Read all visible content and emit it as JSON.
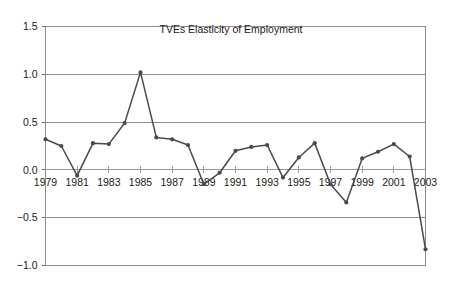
{
  "chart_data": {
    "type": "line",
    "title": "TVEs Elasticity of Employment",
    "xlabel": "",
    "ylabel": "",
    "x": [
      1979,
      1980,
      1981,
      1982,
      1983,
      1984,
      1985,
      1986,
      1987,
      1988,
      1989,
      1990,
      1991,
      1992,
      1993,
      1994,
      1995,
      1996,
      1997,
      1998,
      1999,
      2000,
      2001,
      2002,
      2003
    ],
    "values": [
      0.32,
      0.25,
      -0.06,
      0.28,
      0.27,
      0.49,
      1.02,
      0.34,
      0.32,
      0.26,
      -0.15,
      -0.03,
      0.2,
      0.24,
      0.26,
      -0.08,
      0.13,
      0.28,
      -0.15,
      -0.34,
      0.12,
      0.19,
      0.27,
      0.14,
      -0.83
    ],
    "series": [
      {
        "name": "TVEs Elasticity of Employment",
        "values": [
          0.32,
          0.25,
          -0.06,
          0.28,
          0.27,
          0.49,
          1.02,
          0.34,
          0.32,
          0.26,
          -0.15,
          -0.03,
          0.2,
          0.24,
          0.26,
          -0.08,
          0.13,
          0.28,
          -0.15,
          -0.34,
          0.12,
          0.19,
          0.27,
          0.14,
          -0.83
        ]
      }
    ],
    "xlim": [
      1979,
      2003
    ],
    "ylim": [
      -1.0,
      1.5
    ],
    "yticks": [
      -1.0,
      -0.5,
      0.0,
      0.5,
      1.0,
      1.5
    ],
    "ytick_labels": [
      "−1.0",
      "−0.5",
      "0.0",
      "0.5",
      "1.0",
      "1.5"
    ],
    "xticks": [
      1979,
      1981,
      1983,
      1985,
      1987,
      1989,
      1991,
      1993,
      1995,
      1997,
      1999,
      2001,
      2003
    ],
    "xtick_labels": [
      "1979",
      "1981",
      "1983",
      "1985",
      "1987",
      "1989",
      "1991",
      "1993",
      "1995",
      "1997",
      "1999",
      "2001",
      "2003"
    ],
    "grid": true,
    "legend": false,
    "legend_position": "none",
    "colors": {
      "line": "#4a4a4a",
      "marker": "#4a4a4a",
      "grid": "#8c8c8c",
      "axis": "#8c8c8c",
      "text": "#1a1a1a",
      "background": "#ffffff"
    }
  }
}
